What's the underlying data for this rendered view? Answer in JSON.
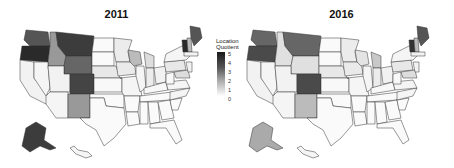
{
  "panels": [
    {
      "title": "2011"
    },
    {
      "title": "2016"
    }
  ],
  "legend": {
    "title_line1": "Location",
    "title_line2": "Quotient",
    "ticks": [
      "5",
      "4",
      "3",
      "2",
      "1",
      "0"
    ],
    "color_high": "#1a1a1a",
    "color_low": "#ffffff"
  },
  "map_data": {
    "metric": "Location Quotient",
    "scale": [
      0,
      5
    ],
    "2011": {
      "OR": 5,
      "WA": 4,
      "MT": 4.2,
      "ID": 2.5,
      "WY": 3.3,
      "CO": 4,
      "NM": 2.5,
      "WI": 1.8,
      "MI": 1.3,
      "VT": 4.5,
      "ME": 3.8,
      "NH": 2,
      "AK": 4,
      "NE": 0.6,
      "MN": 0.4,
      "IA": 0.4,
      "PA": 0.6,
      "MD": 0.8,
      "IN": 0.4
    },
    "2016": {
      "OR": 4,
      "WA": 3.6,
      "MT": 3.6,
      "ID": 0.8,
      "WY": 1,
      "CO": 4,
      "NM": 1.8,
      "WI": 0.8,
      "MI": 1.5,
      "VT": 4.2,
      "ME": 3.8,
      "NH": 2,
      "AK": 2.2,
      "NE": 0.6,
      "MN": 0.5,
      "IA": 0.4,
      "PA": 0.6,
      "MD": 0.8,
      "IN": 0.4
    }
  }
}
